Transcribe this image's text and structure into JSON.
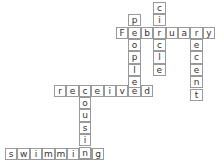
{
  "puzzle": {
    "type": "crossword",
    "cell_size": 12.4,
    "words": [
      {
        "word": "February",
        "direction": "across",
        "x": 116,
        "y": 26.5
      },
      {
        "word": "received",
        "direction": "across",
        "x": 54,
        "y": 84.5
      },
      {
        "word": "swimming",
        "direction": "across",
        "x": 5,
        "y": 147.5
      },
      {
        "word": "circle",
        "direction": "down",
        "x": 153.2,
        "y": 1.7
      },
      {
        "word": "people",
        "direction": "down",
        "x": 128.4,
        "y": 14.1
      },
      {
        "word": "recent",
        "direction": "down",
        "x": 190.4,
        "y": 26.5
      },
      {
        "word": "cousin",
        "direction": "down",
        "x": 78.8,
        "y": 84.5
      }
    ]
  }
}
